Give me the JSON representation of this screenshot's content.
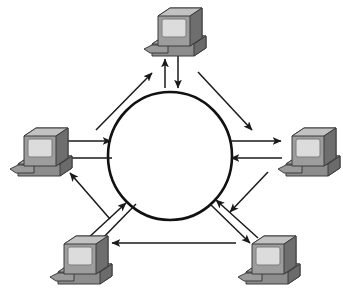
{
  "diagram": {
    "title": "Ring network topology diagram",
    "type": "network-topology",
    "canvas": {
      "width": 343,
      "height": 298
    },
    "colors": {
      "background": "#ffffff",
      "stroke": "#1a1a1a",
      "ring_stroke": "#111111",
      "monitor_case_light": "#b9b9b9",
      "monitor_case_mid": "#9a9a9a",
      "monitor_case_dark": "#6e6e6e",
      "screen": "#d8d8d8",
      "screen_edge": "#8f8f8f",
      "base_light": "#a8a8a8",
      "base_dark": "#707070",
      "outline": "#4a4a4a"
    },
    "ring": {
      "label": "central-ring",
      "cx": 170,
      "cy": 156,
      "rx": 62,
      "ry": 64,
      "stroke_width": 2.6
    },
    "nodes": [
      {
        "id": "node-top",
        "label": "top-computer",
        "x": 172,
        "y": 30,
        "scale": 1.0
      },
      {
        "id": "node-left",
        "label": "left-computer",
        "x": 36,
        "y": 152,
        "scale": 1.0
      },
      {
        "id": "node-right",
        "label": "right-computer",
        "x": 308,
        "y": 152,
        "scale": 1.0
      },
      {
        "id": "node-bottom-left",
        "label": "bottom-left-computer",
        "x": 80,
        "y": 260,
        "scale": 1.0
      },
      {
        "id": "node-bottom-right",
        "label": "bottom-right-computer",
        "x": 268,
        "y": 260,
        "scale": 1.0
      }
    ],
    "connections": [
      {
        "id": "conn-top-in",
        "label": "top-node-to-ring",
        "direction": "to-ring"
      },
      {
        "id": "conn-top-out",
        "label": "ring-to-top-node",
        "direction": "to-node"
      },
      {
        "id": "conn-left-in",
        "label": "left-node-to-ring",
        "direction": "to-ring"
      },
      {
        "id": "conn-left-out",
        "label": "ring-to-left-node",
        "direction": "to-node"
      },
      {
        "id": "conn-right-in",
        "label": "right-node-to-ring",
        "direction": "to-ring"
      },
      {
        "id": "conn-right-out",
        "label": "ring-to-right-node",
        "direction": "to-node"
      },
      {
        "id": "conn-upleft-out",
        "label": "ring-to-top-node-diagonal",
        "direction": "to-node"
      },
      {
        "id": "conn-upright-out",
        "label": "ring-to-right-diagonal",
        "direction": "to-node"
      },
      {
        "id": "conn-bl-in",
        "label": "bottom-left-node-to-ring",
        "direction": "to-ring"
      },
      {
        "id": "conn-bl-out",
        "label": "ring-to-bottom-left-node",
        "direction": "to-node"
      },
      {
        "id": "conn-br-in",
        "label": "bottom-right-node-to-ring",
        "direction": "to-ring"
      },
      {
        "id": "conn-br-out",
        "label": "ring-to-bottom-right-node",
        "direction": "to-node"
      },
      {
        "id": "conn-bottom-span",
        "label": "bottom-right-to-bottom-left",
        "direction": "to-node"
      }
    ]
  }
}
